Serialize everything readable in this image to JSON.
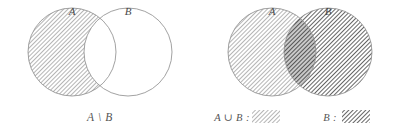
{
  "figure": {
    "background_color": "#ffffff",
    "stroke_color": "#8a8a8a",
    "text_color": "#4a4a4a",
    "hatch_light_color": "#9a9a9a",
    "hatch_dark_color": "#5e5e5e",
    "fill_light_color": "#d8d8d8",
    "fill_dark_color": "#9d9d9d"
  },
  "left_diagram": {
    "name": "set-difference-diagram",
    "circle_a_label": "A",
    "circle_b_label": "B",
    "caption": "A \\ B",
    "shaded_region": "A minus B",
    "circle_a": {
      "cx": 72,
      "cy": 52,
      "r": 44
    },
    "circle_b": {
      "cx": 128,
      "cy": 52,
      "r": 44
    },
    "label_a_pos": {
      "x": 72,
      "y": 14
    },
    "label_b_pos": {
      "x": 128,
      "y": 14
    },
    "caption_pos": {
      "x": 100,
      "y": 120
    }
  },
  "right_diagram": {
    "name": "set-union-diagram",
    "circle_a_label": "A",
    "circle_b_label": "B",
    "shaded_region": "A union B with B darker",
    "circle_a": {
      "cx": 272,
      "cy": 52,
      "r": 44
    },
    "circle_b": {
      "cx": 328,
      "cy": 52,
      "r": 44
    },
    "label_a_pos": {
      "x": 272,
      "y": 14
    },
    "label_b_pos": {
      "x": 328,
      "y": 14
    }
  },
  "legend": {
    "name": "hatch-legend",
    "entries": [
      {
        "label": "A ∪ B :",
        "label_x": 232,
        "swatch_x": 272,
        "swatch_y": 110,
        "swatch_w": 28,
        "swatch_h": 13,
        "pattern": "light-hatch",
        "swatch_fill": "#d8d8d8"
      },
      {
        "label": "B :",
        "label_x": 334,
        "swatch_x": 352,
        "swatch_y": 110,
        "swatch_w": 28,
        "swatch_h": 13,
        "pattern": "dark-hatch",
        "swatch_fill": "#9d9d9d"
      }
    ],
    "baseline_y": 120
  }
}
